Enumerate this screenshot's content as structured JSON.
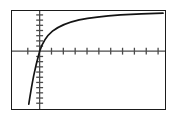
{
  "figure": {
    "background_color": "#ffffff",
    "frame_color": "#1b1b1b",
    "frame_width_px": 155,
    "frame_height_px": 100,
    "axis_color": "#4a4a4a",
    "curve_color": "#141414"
  },
  "chart_data": {
    "type": "line",
    "title": "",
    "subtitle": "",
    "xlabel": "",
    "ylabel": "",
    "grid": false,
    "legend": null,
    "legend_position": "none",
    "function": "y = log(x)",
    "xlim": [
      -1.6,
      11.0
    ],
    "ylim": [
      -4.4,
      3.4
    ],
    "x_axis_tick_count": 14,
    "y_axis_tick_count": 17,
    "x_axis_tick_step": 1,
    "y_axis_tick_step": 0.5,
    "x_intercept": 1,
    "series": [
      {
        "name": "y = log(x)",
        "x": [
          0.09,
          0.12,
          0.16,
          0.21,
          0.28,
          0.36,
          0.47,
          0.61,
          0.8,
          1.0,
          1.3,
          1.7,
          2.2,
          2.9,
          3.7,
          4.8,
          6.2,
          8.0,
          9.2,
          10.4
        ],
        "y": [
          -2.41,
          -2.12,
          -1.83,
          -1.56,
          -1.27,
          -1.02,
          -0.76,
          -0.49,
          -0.22,
          0.0,
          0.26,
          0.53,
          0.79,
          1.06,
          1.31,
          1.57,
          1.82,
          2.08,
          2.22,
          2.34
        ]
      }
    ],
    "axis_ticks": {
      "x_visible_ticks": [
        -1,
        1,
        2,
        3,
        4,
        5,
        6,
        7,
        8,
        9,
        10
      ],
      "y_visible_ticks": [
        -4,
        -3.5,
        -3,
        -2.5,
        -2,
        -1.5,
        -1,
        -0.5,
        0.5,
        1,
        1.5,
        2,
        2.5,
        3
      ],
      "tick_labels_shown": false
    }
  }
}
